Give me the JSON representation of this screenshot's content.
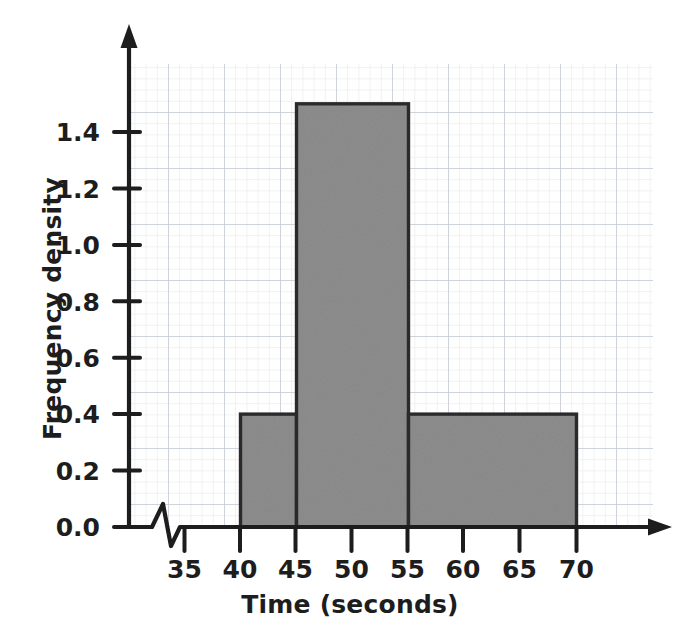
{
  "chart_data": {
    "type": "bar",
    "title": "",
    "subtitle": "",
    "xlabel": "Time (seconds)",
    "ylabel": "Frequency density",
    "grid": true,
    "grid_style": "graph-paper",
    "legend": "none",
    "axis_break_x": true,
    "x_axis_arrow": true,
    "y_axis_arrow": true,
    "xlim": [
      32,
      74
    ],
    "ylim": [
      0.0,
      1.6
    ],
    "xticks": [
      35,
      40,
      45,
      50,
      55,
      60,
      65,
      70
    ],
    "xtick_labels": [
      "35",
      "40",
      "45",
      "50",
      "55",
      "60",
      "65",
      "70"
    ],
    "yticks": [
      0.0,
      0.2,
      0.4,
      0.6,
      0.8,
      1.0,
      1.2,
      1.4
    ],
    "ytick_labels": [
      "0.0",
      "0.2",
      "0.4",
      "0.6",
      "0.8",
      "1.0",
      "1.2",
      "1.4"
    ],
    "bins": [
      {
        "label": "40-45",
        "x0": 40,
        "x1": 45,
        "value": 0.4
      },
      {
        "label": "45-55",
        "x0": 45,
        "x1": 55,
        "value": 1.5
      },
      {
        "label": "55-70",
        "x0": 55,
        "x1": 70,
        "value": 0.4
      }
    ],
    "categories": [
      "40-45",
      "45-55",
      "55-70"
    ],
    "values": [
      0.4,
      1.5,
      0.4
    ],
    "colors": {
      "bar_fill": "#8e8e8e",
      "bar_edge": "#2b2b2b",
      "axis": "#1d1d1d",
      "grid_minor": "#d9dde4",
      "grid_major": "#b9bfc9",
      "background": "#ffffff",
      "text": "#1d1d1d"
    }
  }
}
